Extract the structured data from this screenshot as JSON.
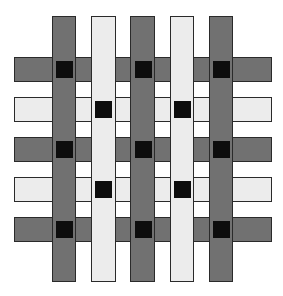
{
  "diagram": {
    "type": "weave-grid",
    "colors": {
      "dark": "#717171",
      "light": "#ececec",
      "knot": "#0d0d0d",
      "border": "#2a2a2a",
      "background": "#ffffff"
    },
    "columns": [
      {
        "tone": "dark",
        "x": 52,
        "y": 16,
        "w": 24,
        "h": 266
      },
      {
        "tone": "light",
        "x": 91,
        "y": 16,
        "w": 25,
        "h": 266
      },
      {
        "tone": "dark",
        "x": 130,
        "y": 16,
        "w": 25,
        "h": 266
      },
      {
        "tone": "light",
        "x": 170,
        "y": 16,
        "w": 24,
        "h": 266
      },
      {
        "tone": "dark",
        "x": 209,
        "y": 16,
        "w": 24,
        "h": 266
      }
    ],
    "rows": [
      {
        "tone": "dark",
        "x": 14,
        "y": 57,
        "w": 258,
        "h": 25
      },
      {
        "tone": "light",
        "x": 14,
        "y": 97,
        "w": 258,
        "h": 25
      },
      {
        "tone": "dark",
        "x": 14,
        "y": 137,
        "w": 258,
        "h": 25
      },
      {
        "tone": "light",
        "x": 14,
        "y": 177,
        "w": 258,
        "h": 25
      },
      {
        "tone": "dark",
        "x": 14,
        "y": 217,
        "w": 258,
        "h": 25
      }
    ],
    "knots": [
      {
        "x": 56,
        "y": 61
      },
      {
        "x": 135,
        "y": 61
      },
      {
        "x": 213,
        "y": 61
      },
      {
        "x": 95,
        "y": 101
      },
      {
        "x": 174,
        "y": 101
      },
      {
        "x": 56,
        "y": 141
      },
      {
        "x": 135,
        "y": 141
      },
      {
        "x": 213,
        "y": 141
      },
      {
        "x": 95,
        "y": 181
      },
      {
        "x": 174,
        "y": 181
      },
      {
        "x": 56,
        "y": 221
      },
      {
        "x": 135,
        "y": 221
      },
      {
        "x": 213,
        "y": 221
      }
    ]
  }
}
